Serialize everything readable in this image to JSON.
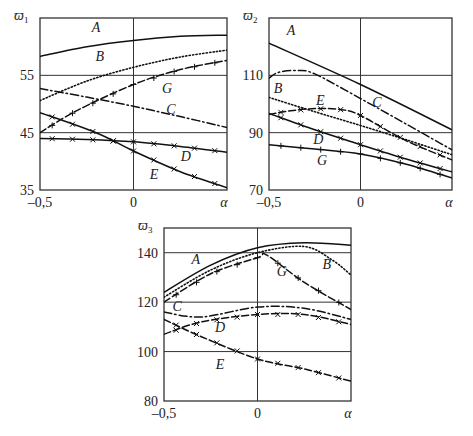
{
  "chart_data": [
    {
      "type": "line",
      "title": "",
      "ylabel": "ϖ1",
      "xlabel": "α",
      "xlim": [
        -0.5,
        0.5
      ],
      "ylim": [
        35,
        65
      ],
      "x_ticks": [
        "–0,5",
        "0",
        "α"
      ],
      "y_ticks": [
        35,
        45,
        55
      ],
      "grid": true,
      "series": [
        {
          "name": "A",
          "style": "solid",
          "marker": "none",
          "x": [
            -0.5,
            -0.25,
            0,
            0.25,
            0.5
          ],
          "values": [
            58.3,
            60.0,
            61.1,
            61.8,
            62.0
          ]
        },
        {
          "name": "B",
          "style": "dotted",
          "marker": "none",
          "x": [
            -0.5,
            -0.25,
            0,
            0.25,
            0.5
          ],
          "values": [
            50.6,
            54.0,
            56.4,
            58.2,
            59.4
          ]
        },
        {
          "name": "G",
          "style": "dash",
          "marker": "plus",
          "x": [
            -0.5,
            -0.3,
            0,
            0.25,
            0.5
          ],
          "values": [
            45.0,
            48.9,
            53.4,
            56.0,
            57.6
          ]
        },
        {
          "name": "C",
          "style": "dashdot",
          "marker": "none",
          "x": [
            -0.5,
            -0.25,
            0,
            0.25,
            0.5
          ],
          "values": [
            52.7,
            51.2,
            49.6,
            47.8,
            45.9
          ]
        },
        {
          "name": "D",
          "style": "solid",
          "marker": "x",
          "x": [
            -0.5,
            -0.25,
            0,
            0.25,
            0.5
          ],
          "values": [
            44.0,
            43.8,
            43.4,
            42.6,
            41.6
          ]
        },
        {
          "name": "E",
          "style": "solid",
          "marker": "x",
          "x": [
            -0.5,
            -0.2,
            0,
            0.25,
            0.5
          ],
          "values": [
            48.5,
            45.0,
            41.8,
            38.2,
            35.4
          ]
        }
      ],
      "labels": [
        {
          "text": "A",
          "x": -0.2,
          "y": 62.5
        },
        {
          "text": "B",
          "x": -0.18,
          "y": 57.5
        },
        {
          "text": "G",
          "x": 0.18,
          "y": 52.0
        },
        {
          "text": "C",
          "x": 0.2,
          "y": 48.3
        },
        {
          "text": "D",
          "x": 0.28,
          "y": 40.0
        },
        {
          "text": "E",
          "x": 0.11,
          "y": 37.0
        }
      ]
    },
    {
      "type": "line",
      "title": "",
      "ylabel": "ϖ2",
      "xlabel": "α",
      "xlim": [
        -0.5,
        0.5
      ],
      "ylim": [
        70,
        130
      ],
      "x_ticks": [
        "–0,5",
        "0",
        "α"
      ],
      "y_ticks": [
        70,
        90,
        110
      ],
      "grid": true,
      "series": [
        {
          "name": "A",
          "style": "solid",
          "marker": "none",
          "x": [
            -0.5,
            0,
            0.5
          ],
          "values": [
            121.2,
            106.8,
            91.0
          ]
        },
        {
          "name": "C",
          "style": "dashdot",
          "marker": "none",
          "x": [
            -0.5,
            -0.45,
            -0.35,
            -0.25,
            0,
            0.25,
            0.5
          ],
          "values": [
            109.0,
            111.0,
            111.7,
            110.5,
            101.9,
            93.0,
            84.0
          ]
        },
        {
          "name": "B",
          "style": "dotted",
          "marker": "none",
          "x": [
            -0.5,
            -0.25,
            0,
            0.25,
            0.5
          ],
          "values": [
            102.3,
            97.3,
            92.5,
            87.5,
            82.3
          ]
        },
        {
          "name": "E",
          "style": "dash",
          "marker": "x",
          "x": [
            -0.5,
            -0.4,
            -0.25,
            -0.1,
            0,
            0.25,
            0.5
          ],
          "values": [
            96.3,
            97.5,
            98.4,
            98.0,
            96.0,
            87.2,
            80.5
          ]
        },
        {
          "name": "D",
          "style": "solid",
          "marker": "x",
          "x": [
            -0.5,
            -0.25,
            0,
            0.25,
            0.5
          ],
          "values": [
            96.7,
            91.0,
            85.8,
            80.8,
            76.3
          ]
        },
        {
          "name": "G",
          "style": "solid",
          "marker": "plus",
          "x": [
            -0.5,
            -0.25,
            0,
            0.25,
            0.5
          ],
          "values": [
            85.8,
            84.3,
            82.6,
            79.0,
            74.2
          ]
        }
      ],
      "labels": [
        {
          "text": "A",
          "x": -0.38,
          "y": 124.0
        },
        {
          "text": "B",
          "x": -0.45,
          "y": 104.0
        },
        {
          "text": "E",
          "x": -0.22,
          "y": 99.6
        },
        {
          "text": "C",
          "x": 0.09,
          "y": 98.8
        },
        {
          "text": "D",
          "x": -0.23,
          "y": 86.0
        },
        {
          "text": "G",
          "x": -0.21,
          "y": 78.8
        }
      ]
    },
    {
      "type": "line",
      "title": "",
      "ylabel": "ϖ3",
      "xlabel": "α",
      "xlim": [
        -0.5,
        0.5
      ],
      "ylim": [
        80,
        150
      ],
      "x_ticks": [
        "–0,5",
        "0",
        "α"
      ],
      "y_ticks": [
        80,
        100,
        120,
        140
      ],
      "grid": true,
      "series": [
        {
          "name": "A",
          "style": "solid",
          "marker": "none",
          "x": [
            -0.5,
            -0.25,
            0,
            0.25,
            0.5
          ],
          "values": [
            124.0,
            135.0,
            142.0,
            144.0,
            143.0
          ]
        },
        {
          "name": "B",
          "style": "dotted",
          "marker": "none",
          "x": [
            -0.5,
            -0.25,
            0,
            0.25,
            0.4,
            0.5
          ],
          "values": [
            122.0,
            133.0,
            140.0,
            142.5,
            137.0,
            131.0
          ]
        },
        {
          "name": "G",
          "style": "dash",
          "marker": "plus",
          "x": [
            -0.5,
            -0.25,
            0,
            0.05,
            0.25,
            0.5
          ],
          "values": [
            120.0,
            131.5,
            138.0,
            139.0,
            128.0,
            117.0
          ]
        },
        {
          "name": "C",
          "style": "dashdot",
          "marker": "none",
          "x": [
            -0.5,
            -0.3,
            0,
            0.25,
            0.5
          ],
          "values": [
            116.0,
            114.0,
            118.0,
            117.5,
            113.0
          ]
        },
        {
          "name": "D",
          "style": "dash",
          "marker": "x",
          "x": [
            -0.5,
            -0.3,
            0,
            0.25,
            0.5
          ],
          "values": [
            107.0,
            112.0,
            115.0,
            115.0,
            111.0
          ]
        },
        {
          "name": "E",
          "style": "dash",
          "marker": "x",
          "x": [
            -0.5,
            -0.3,
            0,
            0.25,
            0.5
          ],
          "values": [
            113.0,
            106.0,
            97.0,
            93.0,
            88.0
          ]
        }
      ],
      "labels": [
        {
          "text": "A",
          "x": -0.33,
          "y": 135.5
        },
        {
          "text": "B",
          "x": 0.37,
          "y": 133.5
        },
        {
          "text": "G",
          "x": 0.13,
          "y": 130.5
        },
        {
          "text": "C",
          "x": -0.43,
          "y": 116.5
        },
        {
          "text": "D",
          "x": -0.2,
          "y": 108.0
        },
        {
          "text": "E",
          "x": -0.2,
          "y": 93.0
        }
      ]
    }
  ]
}
